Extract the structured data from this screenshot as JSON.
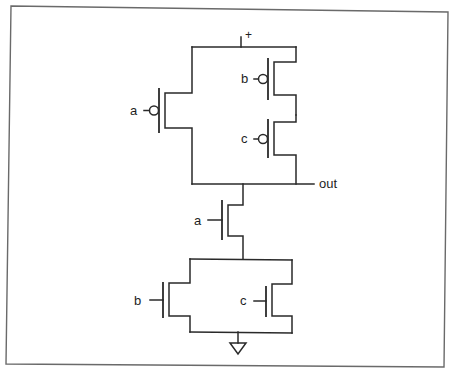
{
  "diagram": {
    "type": "CMOS logic gate schematic",
    "supply_label": "+",
    "output_label": "out",
    "pull_up_network": {
      "transistors": [
        {
          "type": "PMOS",
          "input": "a",
          "arrangement": "parallel-branch-left"
        },
        {
          "type": "PMOS",
          "input": "b",
          "arrangement": "series-right-top"
        },
        {
          "type": "PMOS",
          "input": "c",
          "arrangement": "series-right-bottom"
        }
      ]
    },
    "pull_down_network": {
      "transistors": [
        {
          "type": "NMOS",
          "input": "a",
          "arrangement": "series-top"
        },
        {
          "type": "NMOS",
          "input": "b",
          "arrangement": "parallel-left"
        },
        {
          "type": "NMOS",
          "input": "c",
          "arrangement": "parallel-right"
        }
      ]
    },
    "ground_symbol": "ground-triangle",
    "colors": {
      "line": "#2a2a2a",
      "frame": "#6a6a6a",
      "background": "#ffffff"
    }
  },
  "labels": {
    "pmos_a": "a",
    "pmos_b": "b",
    "pmos_c": "c",
    "nmos_a": "a",
    "nmos_b": "b",
    "nmos_c": "c",
    "vdd": "+",
    "out": "out"
  }
}
